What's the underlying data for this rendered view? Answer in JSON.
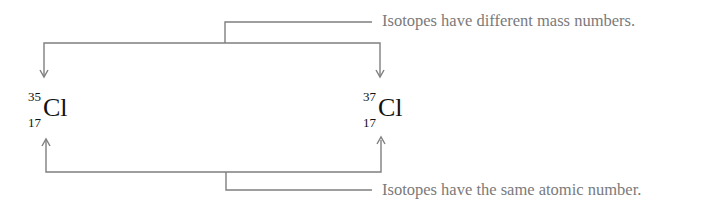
{
  "diagram": {
    "top_label": "Isotopes have different mass numbers.",
    "bottom_label": "Isotopes have the same atomic number.",
    "nuclides": [
      {
        "mass_number": "35",
        "atomic_number": "17",
        "symbol": "Cl"
      },
      {
        "mass_number": "37",
        "atomic_number": "17",
        "symbol": "Cl"
      }
    ],
    "colors": {
      "line": "#7f7f7f",
      "label_text": "#7a7a7a",
      "symbol_text": "#111111"
    }
  }
}
